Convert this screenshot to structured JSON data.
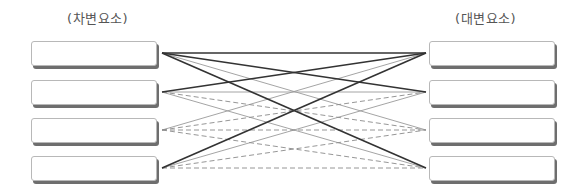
{
  "left_column": {
    "title": "(차변요소)",
    "boxes": [
      {
        "label": ""
      },
      {
        "label": ""
      },
      {
        "label": ""
      },
      {
        "label": ""
      }
    ]
  },
  "right_column": {
    "title": "(대변요소)",
    "boxes": [
      {
        "label": ""
      },
      {
        "label": ""
      },
      {
        "label": ""
      },
      {
        "label": ""
      }
    ]
  },
  "colors": {
    "dark_line": "#333333",
    "light_line": "#9a9a9a",
    "dashed_line": "#8a8a8a",
    "title_text": "#555555",
    "box_border": "#b8b8b8",
    "box_shadow": "#6e6e6e"
  },
  "connections": [
    {
      "from": 1,
      "to": 1,
      "style": "dark"
    },
    {
      "from": 1,
      "to": 2,
      "style": "dark"
    },
    {
      "from": 1,
      "to": 3,
      "style": "light"
    },
    {
      "from": 1,
      "to": 4,
      "style": "dark"
    },
    {
      "from": 2,
      "to": 1,
      "style": "dark"
    },
    {
      "from": 2,
      "to": 2,
      "style": "light"
    },
    {
      "from": 2,
      "to": 3,
      "style": "dashed"
    },
    {
      "from": 2,
      "to": 4,
      "style": "light"
    },
    {
      "from": 3,
      "to": 1,
      "style": "light"
    },
    {
      "from": 3,
      "to": 2,
      "style": "dashed"
    },
    {
      "from": 3,
      "to": 3,
      "style": "dashed"
    },
    {
      "from": 3,
      "to": 4,
      "style": "dashed"
    },
    {
      "from": 4,
      "to": 1,
      "style": "dark"
    },
    {
      "from": 4,
      "to": 2,
      "style": "light"
    },
    {
      "from": 4,
      "to": 3,
      "style": "dashed"
    },
    {
      "from": 4,
      "to": 4,
      "style": "dashed"
    }
  ]
}
